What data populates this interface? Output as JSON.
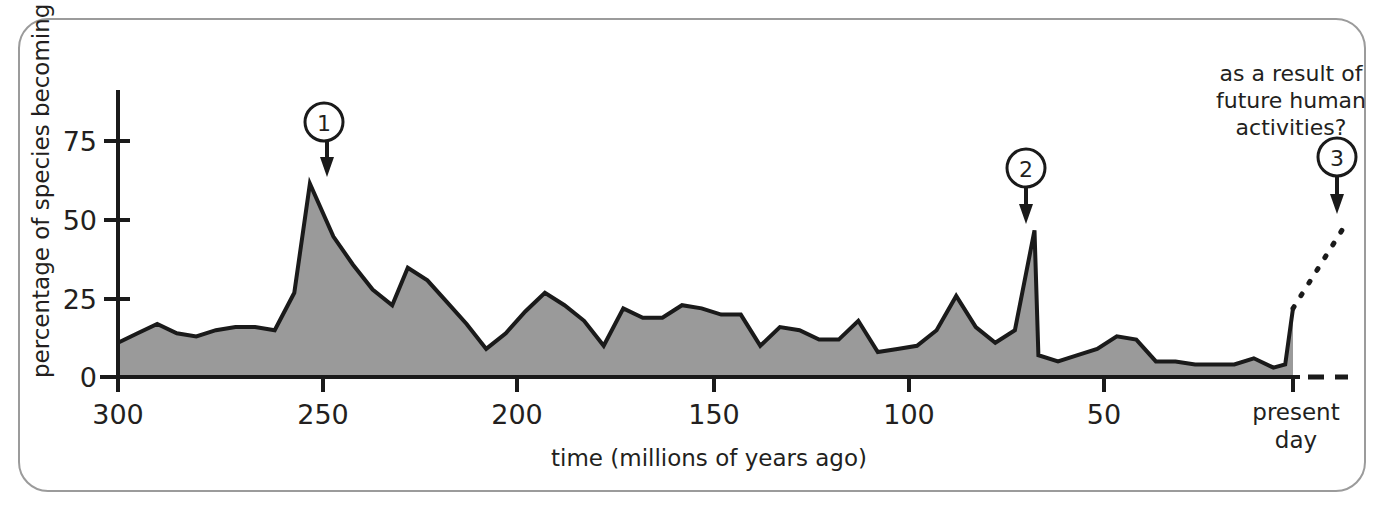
{
  "figure": {
    "border_color": "#9b9b9b",
    "background": "#ffffff",
    "area_fill": "#9a9a9a",
    "line_color": "#1a1a1a"
  },
  "chart_data": {
    "type": "area",
    "title": "",
    "xlabel": "time (millions of years ago)",
    "ylabel": "percentage of species becoming extinct",
    "xlim": [
      300,
      0
    ],
    "ylim": [
      0,
      90
    ],
    "x_ticks": [
      300,
      250,
      200,
      150,
      100,
      50,
      0
    ],
    "x_tick_labels": [
      "300",
      "250",
      "200",
      "150",
      "100",
      "50",
      "present day"
    ],
    "y_ticks": [
      0,
      25,
      50,
      75
    ],
    "y_tick_labels": [
      "0",
      "25",
      "50",
      "75"
    ],
    "grid": false,
    "legend": "none",
    "x_axis_direction": "reversed",
    "series": [
      {
        "name": "percentage of species becoming extinct",
        "x": [
          300,
          295,
          290,
          285,
          280,
          275,
          270,
          265,
          260,
          255,
          251,
          245,
          240,
          235,
          230,
          226,
          221,
          216,
          211,
          206,
          201,
          196,
          191,
          186,
          181,
          176,
          171,
          166,
          161,
          156,
          151,
          146,
          141,
          136,
          131,
          126,
          121,
          116,
          111,
          106,
          101,
          96,
          91,
          86,
          81,
          76,
          71,
          66,
          65,
          60,
          55,
          50,
          45,
          40,
          35,
          30,
          25,
          20,
          15,
          10,
          5,
          2,
          0
        ],
        "y": [
          11,
          14,
          17,
          14,
          13,
          15,
          16,
          16,
          15,
          27,
          62,
          45,
          36,
          28,
          23,
          35,
          31,
          24,
          17,
          9,
          14,
          21,
          27,
          23,
          18,
          10,
          22,
          19,
          19,
          23,
          22,
          20,
          20,
          10,
          16,
          15,
          12,
          12,
          18,
          8,
          9,
          10,
          15,
          26,
          16,
          11,
          15,
          47,
          7,
          5,
          7,
          9,
          13,
          12,
          5,
          5,
          4,
          4,
          4,
          6,
          3,
          4,
          22
        ],
        "color": "#9a9a9a"
      }
    ],
    "projection": {
      "name": "projected future extinction",
      "style": "dashed",
      "x": [
        0,
        -13
      ],
      "y": [
        22,
        48
      ]
    },
    "annotations": [
      {
        "id": "1",
        "label": "1",
        "target_x": 251,
        "target_y": 62,
        "note": ""
      },
      {
        "id": "2",
        "label": "2",
        "target_x": 66,
        "target_y": 47,
        "note": ""
      },
      {
        "id": "3",
        "label": "3",
        "target_x": -9,
        "target_y": 40,
        "note": "as a result of future human activities?"
      }
    ]
  },
  "labels": {
    "y_axis_title": "percentage of species becoming extinct",
    "x_axis_title": "time (millions of years ago)",
    "present_day_line1": "present",
    "present_day_line2": "day",
    "annotation_line1": "as a result of",
    "annotation_line2": "future human",
    "annotation_line3": "activities?",
    "callout_1": "1",
    "callout_2": "2",
    "callout_3": "3",
    "ytick_0": "0",
    "ytick_25": "25",
    "ytick_50": "50",
    "ytick_75": "75",
    "xtick_300": "300",
    "xtick_250": "250",
    "xtick_200": "200",
    "xtick_150": "150",
    "xtick_100": "100",
    "xtick_50": "50"
  }
}
